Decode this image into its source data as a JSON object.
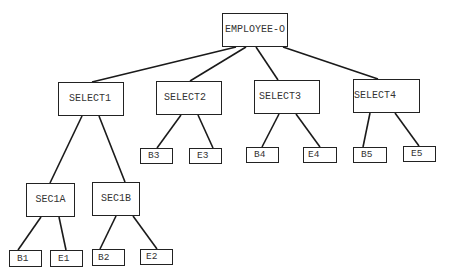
{
  "diagram": {
    "type": "tree",
    "root": {
      "id": "employee-o",
      "label": "EMPLOYEE-O",
      "box": {
        "x": 222,
        "y": 13,
        "w": 66,
        "h": 34
      }
    },
    "nodes": {
      "select1": {
        "label": "SELECT1",
        "box": {
          "x": 58,
          "y": 82,
          "w": 66,
          "h": 34
        }
      },
      "select2": {
        "label": "SELECT2",
        "box": {
          "x": 156,
          "y": 81,
          "w": 66,
          "h": 34
        }
      },
      "select3": {
        "label": "SELECT3",
        "box": {
          "x": 254,
          "y": 80,
          "w": 66,
          "h": 34
        }
      },
      "select4": {
        "label": "SELECT4",
        "box": {
          "x": 353,
          "y": 79,
          "w": 67,
          "h": 34
        }
      },
      "sec1a": {
        "label": "SEC1A",
        "box": {
          "x": 26,
          "y": 183,
          "w": 49,
          "h": 34
        }
      },
      "sec1b": {
        "label": "SEC1B",
        "box": {
          "x": 92,
          "y": 182,
          "w": 48,
          "h": 34
        }
      },
      "b1": {
        "label": "B1",
        "box": {
          "x": 9,
          "y": 250,
          "w": 33,
          "h": 17
        }
      },
      "e1": {
        "label": "E1",
        "box": {
          "x": 50,
          "y": 250,
          "w": 33,
          "h": 17
        }
      },
      "b2": {
        "label": "B2",
        "box": {
          "x": 92,
          "y": 249,
          "w": 33,
          "h": 17
        }
      },
      "e2": {
        "label": "E2",
        "box": {
          "x": 140,
          "y": 249,
          "w": 33,
          "h": 16
        }
      },
      "b3": {
        "label": "B3",
        "box": {
          "x": 140,
          "y": 148,
          "w": 33,
          "h": 16
        }
      },
      "e3": {
        "label": "E3",
        "box": {
          "x": 189,
          "y": 148,
          "w": 33,
          "h": 16
        }
      },
      "b4": {
        "label": "B4",
        "box": {
          "x": 246,
          "y": 147,
          "w": 33,
          "h": 16
        }
      },
      "e4": {
        "label": "E4",
        "box": {
          "x": 303,
          "y": 147,
          "w": 34,
          "h": 16
        }
      },
      "b5": {
        "label": "B5",
        "box": {
          "x": 353,
          "y": 147,
          "w": 34,
          "h": 16
        }
      },
      "e5": {
        "label": "E5",
        "box": {
          "x": 403,
          "y": 146,
          "w": 33,
          "h": 16
        }
      }
    },
    "edges": [
      {
        "from": "EMPLOYEE-O",
        "to": "SELECT1",
        "x1": 236,
        "y1": 47,
        "x2": 92,
        "y2": 82
      },
      {
        "from": "EMPLOYEE-O",
        "to": "SELECT2",
        "x1": 246,
        "y1": 47,
        "x2": 190,
        "y2": 81
      },
      {
        "from": "EMPLOYEE-O",
        "to": "SELECT3",
        "x1": 256,
        "y1": 47,
        "x2": 278,
        "y2": 80
      },
      {
        "from": "EMPLOYEE-O",
        "to": "SELECT4",
        "x1": 283,
        "y1": 47,
        "x2": 378,
        "y2": 79
      },
      {
        "from": "SELECT1",
        "to": "SEC1A",
        "x1": 82,
        "y1": 116,
        "x2": 50,
        "y2": 183
      },
      {
        "from": "SELECT1",
        "to": "SEC1B",
        "x1": 99,
        "y1": 116,
        "x2": 125,
        "y2": 182
      },
      {
        "from": "SEC1A",
        "to": "B1",
        "x1": 41,
        "y1": 217,
        "x2": 18,
        "y2": 250
      },
      {
        "from": "SEC1A",
        "to": "E1",
        "x1": 59,
        "y1": 217,
        "x2": 66,
        "y2": 250
      },
      {
        "from": "SEC1B",
        "to": "B2",
        "x1": 116,
        "y1": 216,
        "x2": 100,
        "y2": 249
      },
      {
        "from": "SEC1B",
        "to": "E2",
        "x1": 133,
        "y1": 216,
        "x2": 157,
        "y2": 249
      },
      {
        "from": "SELECT2",
        "to": "B3",
        "x1": 181,
        "y1": 115,
        "x2": 157,
        "y2": 148
      },
      {
        "from": "SELECT2",
        "to": "E3",
        "x1": 198,
        "y1": 115,
        "x2": 213,
        "y2": 148
      },
      {
        "from": "SELECT3",
        "to": "B4",
        "x1": 279,
        "y1": 114,
        "x2": 262,
        "y2": 147
      },
      {
        "from": "SELECT3",
        "to": "E4",
        "x1": 296,
        "y1": 114,
        "x2": 320,
        "y2": 147
      },
      {
        "from": "SELECT4",
        "to": "B5",
        "x1": 370,
        "y1": 113,
        "x2": 363,
        "y2": 147
      },
      {
        "from": "SELECT4",
        "to": "E5",
        "x1": 395,
        "y1": 113,
        "x2": 419,
        "y2": 146
      }
    ]
  }
}
